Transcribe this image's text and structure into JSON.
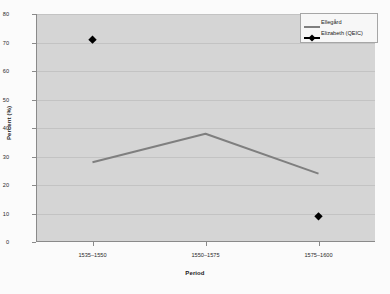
{
  "chart_data": {
    "type": "line",
    "title": "",
    "xlabel": "Period",
    "ylabel": "Percent (%)",
    "categories": [
      "1535–1550",
      "1550–1575",
      "1575–1600"
    ],
    "ylim": [
      0,
      80
    ],
    "ytick_step": 10,
    "yticks": [
      0,
      10,
      20,
      30,
      40,
      50,
      60,
      70,
      80
    ],
    "grid": true,
    "legend_position": "top-right",
    "series": [
      {
        "name": "Ellegård",
        "marker": "none",
        "style": "line",
        "color": "#7f7f7f",
        "values": [
          28,
          38,
          24
        ]
      },
      {
        "name": "Elizabeth (QEIC)",
        "marker": "diamond",
        "style": "markers",
        "color": "#000000",
        "values": [
          71,
          null,
          9
        ]
      }
    ]
  },
  "axes": {
    "y_title": "Percent (%)",
    "x_title": "Period",
    "y_tick_labels": [
      "80",
      "70",
      "60",
      "50",
      "40",
      "30",
      "20",
      "10",
      "0"
    ],
    "x_tick_labels": [
      "1535–1550",
      "1550–1575",
      "1575–1600"
    ]
  },
  "legend": {
    "items": [
      {
        "label": "Ellegård",
        "color": "#7f7f7f",
        "marker": "none"
      },
      {
        "label": "Elizabeth (QEIC)",
        "color": "#000000",
        "marker": "diamond"
      }
    ]
  },
  "colors": {
    "plot_background": "#d5d5d5",
    "page_background": "#fbfbfb",
    "gridline": "#c3c3c3",
    "axis": "#8a8a8a",
    "line_series": "#7f7f7f",
    "marker_series": "#000000"
  }
}
